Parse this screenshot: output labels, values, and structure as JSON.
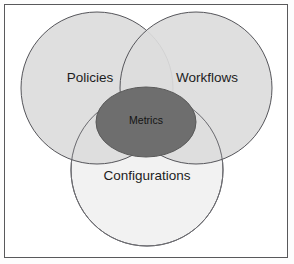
{
  "diagram": {
    "type": "venn",
    "set_count": 3,
    "background_color": "#ffffff",
    "frame": {
      "name": "outer-frame",
      "border_color": "#59595b"
    },
    "sets": [
      {
        "id": "policies",
        "label": "Policies",
        "fill_color": "#dcdcdc",
        "stroke_color": "#55555a",
        "cx": 97,
        "cy": 88,
        "r": 76
      },
      {
        "id": "workflows",
        "label": "Workflows",
        "fill_color": "#dcdcdc",
        "stroke_color": "#55555a",
        "cx": 196,
        "cy": 88,
        "r": 76
      },
      {
        "id": "configurations",
        "label": "Configurations",
        "fill_color": "#f2f2f2",
        "stroke_color": "#55555a",
        "cx": 147,
        "cy": 170,
        "r": 76
      }
    ],
    "intersection": {
      "id": "metrics",
      "label": "Metrics",
      "fill_color": "#6e6e6e",
      "stroke_color": "#5a5a5a",
      "cx": 146,
      "cy": 122,
      "rx": 50,
      "ry": 35
    },
    "label_positions": {
      "policies": {
        "x": 90,
        "y": 78
      },
      "workflows": {
        "x": 207,
        "y": 78
      },
      "configurations": {
        "x": 147,
        "y": 176
      },
      "metrics": {
        "x": 146,
        "y": 121
      }
    }
  }
}
